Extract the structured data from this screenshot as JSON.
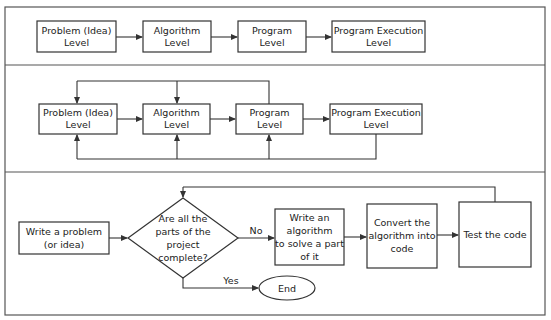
{
  "colors": {
    "stroke": "#333333",
    "text": "#222222",
    "background": "#ffffff"
  },
  "panel1": {
    "boxes": [
      {
        "line1": "Problem (Idea)",
        "line2": "Level"
      },
      {
        "line1": "Algorithm",
        "line2": "Level"
      },
      {
        "line1": "Program",
        "line2": "Level"
      },
      {
        "line1": "Program Execution",
        "line2": "Level"
      }
    ]
  },
  "panel2": {
    "boxes": [
      {
        "line1": "Problem (Idea)",
        "line2": "Level"
      },
      {
        "line1": "Algorithm",
        "line2": "Level"
      },
      {
        "line1": "Program",
        "line2": "Level"
      },
      {
        "line1": "Program Execution",
        "line2": "Level"
      }
    ]
  },
  "panel3": {
    "start": {
      "line1": "Write a problem",
      "line2": "(or idea)"
    },
    "decision": {
      "line1": "Are all the",
      "line2": "parts of the",
      "line3": "project",
      "line4": "complete?"
    },
    "no_label": "No",
    "yes_label": "Yes",
    "write_algorithm": {
      "line1": "Write an",
      "line2": "algorithm",
      "line3": "to solve a part",
      "line4": "of it"
    },
    "convert": {
      "line1": "Convert the",
      "line2": "algorithm into",
      "line3": "code"
    },
    "test": {
      "line1": "Test the code"
    },
    "end": {
      "label": "End"
    }
  }
}
